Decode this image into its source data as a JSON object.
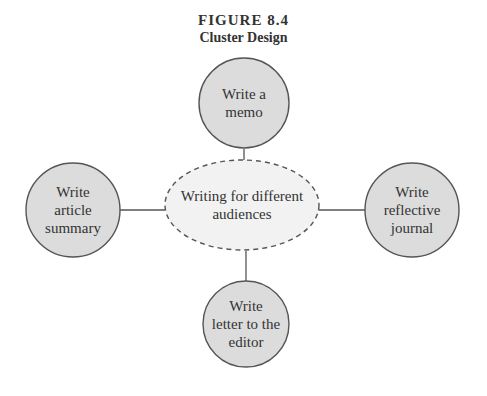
{
  "figure": {
    "number": "FIGURE 8.4",
    "title": "Cluster Design"
  },
  "center": {
    "lines": [
      "Writing for different",
      "audiences"
    ]
  },
  "nodes": [
    {
      "id": "top",
      "lines": [
        "Write a",
        "memo"
      ]
    },
    {
      "id": "left",
      "lines": [
        "Write",
        "article",
        "summary"
      ]
    },
    {
      "id": "right",
      "lines": [
        "Write",
        "reflective",
        "journal"
      ]
    },
    {
      "id": "bottom",
      "lines": [
        "Write",
        "letter to the",
        "editor"
      ]
    }
  ],
  "colors": {
    "node_fill": "#dcdcdc",
    "center_fill": "#f2f2f2",
    "stroke": "#555555"
  }
}
